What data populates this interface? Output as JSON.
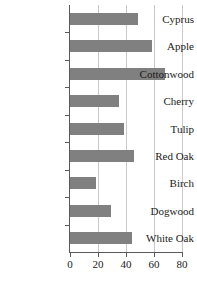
{
  "chart_data": {
    "type": "bar",
    "orientation": "horizontal",
    "title": "",
    "xlabel": "",
    "ylabel": "",
    "categories": [
      "Cyprus",
      "Apple",
      "Cottonwood",
      "Cherry",
      "Tulip",
      "Red Oak",
      "Birch",
      "Dogwood",
      "White Oak"
    ],
    "values": [
      48.5,
      58.5,
      68,
      35,
      38.5,
      45.5,
      18.5,
      29,
      44
    ],
    "xlim": [
      0,
      80
    ],
    "xticks": [
      0,
      20,
      40,
      60,
      80
    ],
    "xtick_labels": [
      "0",
      "20",
      "40",
      "60",
      "80"
    ],
    "grid": "vertical",
    "legend": "none",
    "bar_color": "#808080",
    "axis_color": "#5a5a5a",
    "gridline_color": "#c9c9c9",
    "background_color": "#ffffff"
  }
}
